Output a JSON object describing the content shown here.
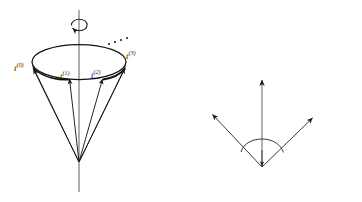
{
  "figure": {
    "title": "",
    "background_color": "#ffffff",
    "ink_color": "#1a1a1a",
    "panels": [
      {
        "name": "cone-orbit-panel",
        "description": "Cone swept by successive rotations of vector t about a vertical axis"
      },
      {
        "name": "rotation-angle-panel",
        "description": "Vector t with its images under Cn and Cn inverse separated by angle 2pi/n"
      }
    ]
  },
  "cone_panel": {
    "axis_label": "",
    "rotation_arrow": "curved-rotation-arrow",
    "ellipsis": "...",
    "vectors": [
      {
        "id": "t0",
        "label_main": "t",
        "label_sup": "(0)"
      },
      {
        "id": "t1",
        "label_main": "t",
        "label_sup": "(1)"
      },
      {
        "id": "t2",
        "label_main": "t",
        "label_sup": "(2)"
      },
      {
        "id": "t3",
        "label_main": "t",
        "label_sup": "(3)"
      }
    ]
  },
  "angle_panel": {
    "axis_vector_label": "t",
    "left_vector": {
      "label_main": "C",
      "label_sub": "n",
      "label_tail": "t"
    },
    "right_vector": {
      "label_main": "C",
      "label_sup": "−1",
      "label_sub": "n",
      "label_tail": "t"
    },
    "angle": {
      "numerator": "2π",
      "denominator": "n",
      "display": "2π/n"
    }
  }
}
